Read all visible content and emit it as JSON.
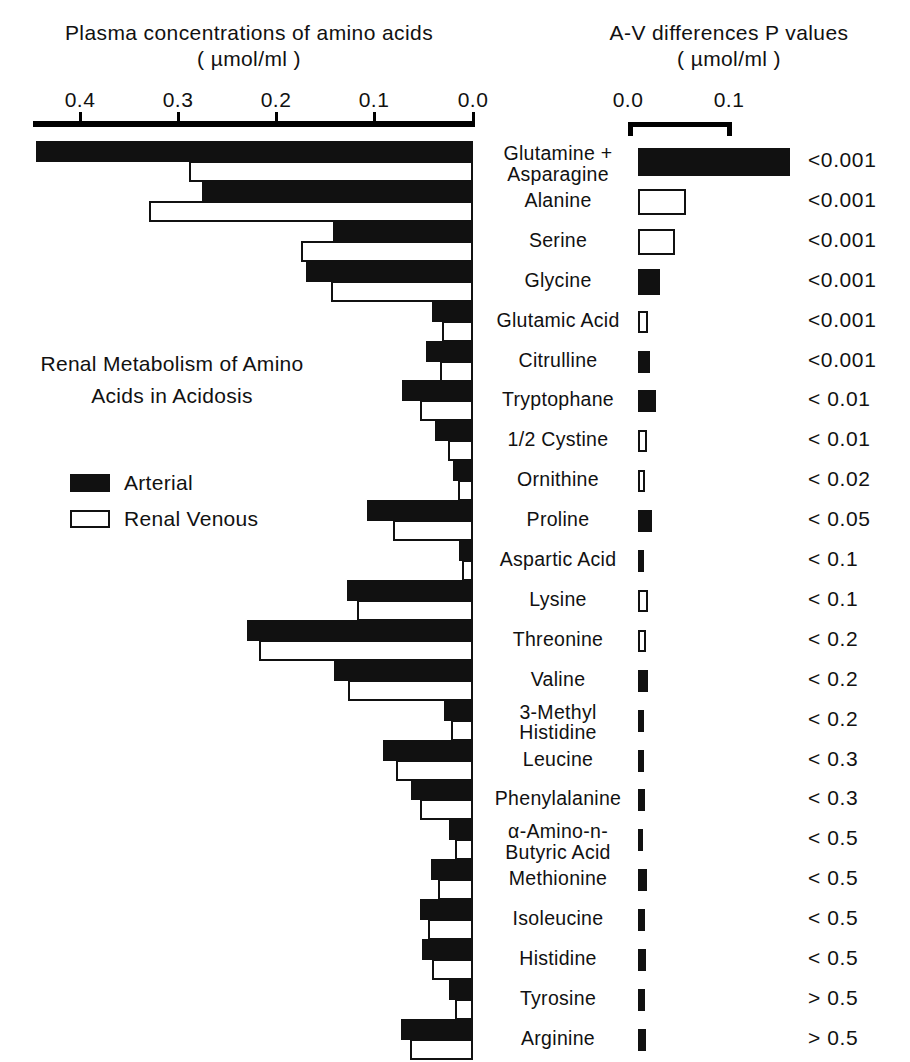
{
  "left_header": {
    "line1": "Plasma concentrations of amino acids",
    "line2": "( µmol/ml )"
  },
  "right_header": {
    "line1": "A-V differences P values",
    "line2": "( µmol/ml )"
  },
  "caption": {
    "line1": "Renal Metabolism of Amino",
    "line2": "Acids in Acidosis"
  },
  "legend": {
    "arterial": "Arterial",
    "renal_venous": "Renal Venous"
  },
  "left_axis": {
    "ticks": [
      "0.4",
      "0.3",
      "0.2",
      "0.1",
      "0.0"
    ]
  },
  "right_axis": {
    "ticks": [
      "0.0",
      "0.1"
    ]
  },
  "chart_data": {
    "type": "bar",
    "title": "Renal Metabolism of Amino Acids in Acidosis",
    "subtitle": "Plasma concentrations of amino acids (µmol/ml); A-V differences (µmol/ml); P values",
    "orientation": "horizontal",
    "left_panel": {
      "xlabel": "Plasma concentrations of amino acids ( µmol/ml )",
      "xlim": [
        0.0,
        0.45
      ],
      "direction": "right-to-left",
      "ticks": [
        0.4,
        0.3,
        0.2,
        0.1,
        0.0
      ],
      "grid": false,
      "series": [
        {
          "name": "Arterial",
          "fill": "solid"
        },
        {
          "name": "Renal Venous",
          "fill": "open"
        }
      ]
    },
    "right_panel": {
      "xlabel": "A-V differences ( µmol/ml )",
      "xlim": [
        0.0,
        0.16
      ],
      "direction": "left-to-right",
      "ticks": [
        0.0,
        0.1
      ],
      "grid": false
    },
    "categories": [
      "Glutamine + Asparagine",
      "Alanine",
      "Serine",
      "Glycine",
      "Glutamic Acid",
      "Citrulline",
      "Tryptophane",
      "1/2 Cystine",
      "Ornithine",
      "Proline",
      "Aspartic Acid",
      "Lysine",
      "Threonine",
      "Valine",
      "3-Methyl Histidine",
      "Leucine",
      "Phenylalanine",
      "α-Amino-n-Butyric Acid",
      "Methionine",
      "Isoleucine",
      "Histidine",
      "Tyrosine",
      "Arginine"
    ],
    "arterial": [
      0.445,
      0.276,
      0.143,
      0.17,
      0.042,
      0.048,
      0.072,
      0.039,
      0.02,
      0.108,
      0.014,
      0.128,
      0.23,
      0.142,
      0.03,
      0.092,
      0.063,
      0.024,
      0.043,
      0.054,
      0.052,
      0.024,
      0.073
    ],
    "renal_venous": [
      0.29,
      0.33,
      0.175,
      0.145,
      0.032,
      0.034,
      0.054,
      0.025,
      0.015,
      0.082,
      0.011,
      0.118,
      0.218,
      0.127,
      0.022,
      0.078,
      0.054,
      0.018,
      0.036,
      0.046,
      0.042,
      0.018,
      0.064
    ],
    "av_difference": [
      0.152,
      0.048,
      0.037,
      0.022,
      0.01,
      0.012,
      0.018,
      0.009,
      0.007,
      0.014,
      0.006,
      0.01,
      0.008,
      0.01,
      0.006,
      0.006,
      0.007,
      0.004,
      0.009,
      0.007,
      0.008,
      0.007,
      0.008
    ],
    "av_fill": [
      "solid",
      "open",
      "open",
      "solid",
      "open",
      "solid",
      "solid",
      "open",
      "open",
      "solid",
      "solid",
      "open",
      "open",
      "solid",
      "solid",
      "solid",
      "solid",
      "solid",
      "solid",
      "solid",
      "solid",
      "solid",
      "solid"
    ],
    "p_values": [
      "<0.001",
      "<0.001",
      "<0.001",
      "<0.001",
      "<0.001",
      "<0.001",
      "< 0.01",
      "< 0.01",
      "< 0.02",
      "< 0.05",
      "< 0.1",
      "< 0.1",
      "< 0.2",
      "< 0.2",
      "< 0.2",
      "< 0.3",
      "< 0.3",
      "< 0.5",
      "< 0.5",
      "< 0.5",
      "< 0.5",
      "> 0.5",
      "> 0.5"
    ]
  },
  "rows": [
    {
      "label1": "Glutamine +",
      "label2": "Asparagine",
      "p": "<0.001"
    },
    {
      "label1": "Alanine",
      "label2": "",
      "p": "<0.001"
    },
    {
      "label1": "Serine",
      "label2": "",
      "p": "<0.001"
    },
    {
      "label1": "Glycine",
      "label2": "",
      "p": "<0.001"
    },
    {
      "label1": "Glutamic Acid",
      "label2": "",
      "p": "<0.001"
    },
    {
      "label1": "Citrulline",
      "label2": "",
      "p": "<0.001"
    },
    {
      "label1": "Tryptophane",
      "label2": "",
      "p": "< 0.01"
    },
    {
      "label1": "1/2 Cystine",
      "label2": "",
      "p": "< 0.01"
    },
    {
      "label1": "Ornithine",
      "label2": "",
      "p": "< 0.02"
    },
    {
      "label1": "Proline",
      "label2": "",
      "p": "< 0.05"
    },
    {
      "label1": "Aspartic Acid",
      "label2": "",
      "p": "< 0.1"
    },
    {
      "label1": "Lysine",
      "label2": "",
      "p": "< 0.1"
    },
    {
      "label1": "Threonine",
      "label2": "",
      "p": "< 0.2"
    },
    {
      "label1": "Valine",
      "label2": "",
      "p": "< 0.2"
    },
    {
      "label1": "3-Methyl",
      "label2": "Histidine",
      "p": "< 0.2"
    },
    {
      "label1": "Leucine",
      "label2": "",
      "p": "< 0.3"
    },
    {
      "label1": "Phenylalanine",
      "label2": "",
      "p": "< 0.3"
    },
    {
      "label1": "α-Amino-n-",
      "label2": "Butyric Acid",
      "p": "< 0.5"
    },
    {
      "label1": "Methionine",
      "label2": "",
      "p": "< 0.5"
    },
    {
      "label1": "Isoleucine",
      "label2": "",
      "p": "< 0.5"
    },
    {
      "label1": "Histidine",
      "label2": "",
      "p": "< 0.5"
    },
    {
      "label1": "Tyrosine",
      "label2": "",
      "p": "> 0.5"
    },
    {
      "label1": "Arginine",
      "label2": "",
      "p": "> 0.5"
    }
  ]
}
